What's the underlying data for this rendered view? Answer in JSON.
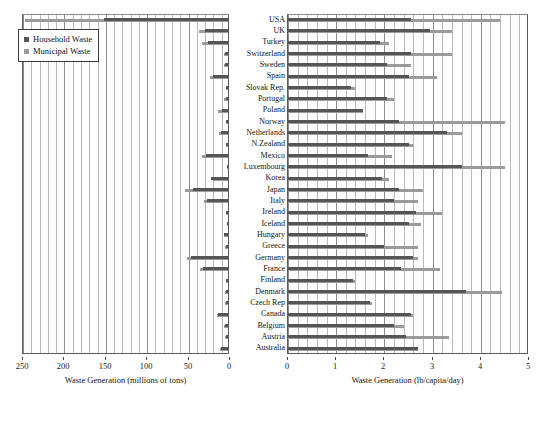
{
  "chart_data": {
    "type": "bar",
    "orientation": "horizontal",
    "title": "",
    "legend": {
      "position": "top-left-inside-left-panel",
      "entries": [
        {
          "label": "Household Waste",
          "color": "#555555",
          "key": "household"
        },
        {
          "label": "Municipal Waste",
          "color": "#9a9a9a",
          "key": "municipal"
        }
      ]
    },
    "categories": [
      "USA",
      "UK",
      "Turkey",
      "Switzerland",
      "Sweden",
      "Spain",
      "Slovak Rep.",
      "Portugal",
      "Poland",
      "Norway",
      "Netherlands",
      "N.Zealand",
      "Mexico",
      "Luxembourg",
      "Korea",
      "Japan",
      "Italy",
      "Ireland",
      "Iceland",
      "Hungary",
      "Greece",
      "Germany",
      "France",
      "Finland",
      "Denmark",
      "Czech Rep",
      "Canada",
      "Belgium",
      "Austria",
      "Australia"
    ],
    "panels": [
      {
        "id": "left-panel",
        "xlabel": "Waste Generation (millions of tons)",
        "xlim": [
          250,
          0
        ],
        "reversed": true,
        "ticks": [
          250,
          200,
          150,
          100,
          50,
          0
        ],
        "grid": true,
        "series": [
          {
            "name": "Household Waste",
            "key": "household",
            "color": "#555555",
            "values": [
              150,
              28,
              24,
              4,
              4,
              18,
              2,
              3,
              7,
              2,
              9,
              2,
              27,
              1,
              20,
              42,
              25,
              2,
              0.2,
              5,
              3,
              45,
              30,
              2,
              3,
              3,
              12,
              4,
              3,
              8
            ]
          },
          {
            "name": "Municipal Waste",
            "key": "municipal",
            "color": "#9a9a9a",
            "values": [
              245,
              35,
              31,
              5,
              4.5,
              22,
              2.5,
              4.5,
              12,
              3,
              11,
              2.5,
              31,
              0.6,
              18,
              52,
              29,
              2.5,
              0.3,
              5,
              4,
              50,
              34,
              2.5,
              3.5,
              4,
              13,
              5,
              4,
              10
            ]
          }
        ]
      },
      {
        "id": "right-panel",
        "xlabel": "Waste Generation (lb/capita/day)",
        "xlim": [
          0,
          5
        ],
        "reversed": false,
        "ticks": [
          0,
          1,
          2,
          3,
          4,
          5
        ],
        "grid": true,
        "series": [
          {
            "name": "Household Waste",
            "key": "household",
            "color": "#555555",
            "values": [
              2.55,
              2.95,
              1.9,
              2.55,
              2.05,
              2.5,
              1.3,
              2.05,
              1.55,
              2.3,
              3.3,
              2.5,
              1.65,
              3.6,
              1.95,
              2.3,
              2.2,
              2.65,
              2.5,
              1.6,
              2.0,
              2.6,
              2.35,
              1.35,
              3.7,
              1.7,
              2.55,
              2.2,
              2.45,
              2.7
            ]
          },
          {
            "name": "Municipal Waste",
            "key": "municipal",
            "color": "#9a9a9a",
            "values": [
              4.4,
              3.4,
              2.1,
              3.4,
              2.55,
              3.1,
              1.4,
              2.2,
              1.55,
              4.5,
              3.6,
              2.6,
              2.15,
              4.5,
              2.1,
              2.8,
              2.7,
              3.2,
              2.75,
              1.65,
              2.7,
              2.7,
              3.15,
              1.4,
              4.45,
              1.75,
              2.6,
              2.4,
              3.35,
              2.7
            ]
          }
        ]
      }
    ]
  }
}
